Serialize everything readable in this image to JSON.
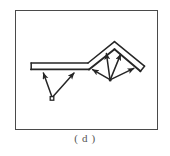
{
  "figure": {
    "caption": "( d )",
    "frame": {
      "x": 15,
      "y": 10,
      "width": 143,
      "height": 120,
      "stroke_color": "#4a4a4a",
      "stroke_width": 1.6,
      "fill": "#ffffff"
    },
    "diagram": {
      "type": "schematic-line-drawing",
      "description": "Flat horizontal beam on the left joined to a peaked gable roof on the right, with force arrows radiating upward from two support nodes to the underside of the beam and roof slopes",
      "stroke_color": "#262626",
      "background": "#ffffff",
      "members": [
        {
          "name": "flat-beam",
          "kind": "double-line-slab",
          "top_line": {
            "x1": 15,
            "y1": 52,
            "x2": 72,
            "y2": 52
          },
          "bottom_line": {
            "x1": 15,
            "y1": 58,
            "x2": 72,
            "y2": 58
          },
          "left_cap": {
            "x1": 15,
            "y1": 52,
            "x2": 15,
            "y2": 58
          }
        },
        {
          "name": "roof-left-slope",
          "kind": "double-line-slab",
          "outer_line": {
            "x1": 72,
            "y1": 52,
            "x2": 98,
            "y2": 31
          },
          "inner_line": {
            "x1": 72,
            "y1": 58,
            "x2": 98,
            "y2": 38
          }
        },
        {
          "name": "roof-right-slope",
          "kind": "double-line-slab",
          "outer_line": {
            "x1": 98,
            "y1": 31,
            "x2": 128,
            "y2": 55
          },
          "inner_line": {
            "x1": 98,
            "y1": 38,
            "x2": 125,
            "y2": 60
          },
          "end_cap": {
            "x1": 128,
            "y1": 55,
            "x2": 125,
            "y2": 60
          }
        }
      ],
      "nodes": [
        {
          "name": "left-support-node",
          "shape": "small-square",
          "x": 36,
          "y": 87,
          "size": 3.4
        },
        {
          "name": "right-support-node",
          "shape": "point",
          "x": 94,
          "y": 69,
          "size": 2.4
        }
      ],
      "arrows": [
        {
          "name": "left-arrow-1",
          "from_node": "left-support-node",
          "x1": 36,
          "y1": 87,
          "x2": 27,
          "y2": 61
        },
        {
          "name": "left-arrow-2",
          "from_node": "left-support-node",
          "x1": 36,
          "y1": 87,
          "x2": 58,
          "y2": 61
        },
        {
          "name": "right-arrow-1",
          "from_node": "right-support-node",
          "x1": 94,
          "y1": 69,
          "x2": 76,
          "y2": 58
        },
        {
          "name": "right-arrow-2",
          "from_node": "right-support-node",
          "x1": 94,
          "y1": 69,
          "x2": 90,
          "y2": 42
        },
        {
          "name": "right-arrow-3",
          "from_node": "right-support-node",
          "x1": 94,
          "y1": 69,
          "x2": 104,
          "y2": 43
        },
        {
          "name": "right-arrow-4",
          "from_node": "right-support-node",
          "x1": 94,
          "y1": 69,
          "x2": 118,
          "y2": 57
        }
      ],
      "arrow_count": {
        "left_beam": 2,
        "right_roof": 4,
        "total": 6
      }
    }
  }
}
